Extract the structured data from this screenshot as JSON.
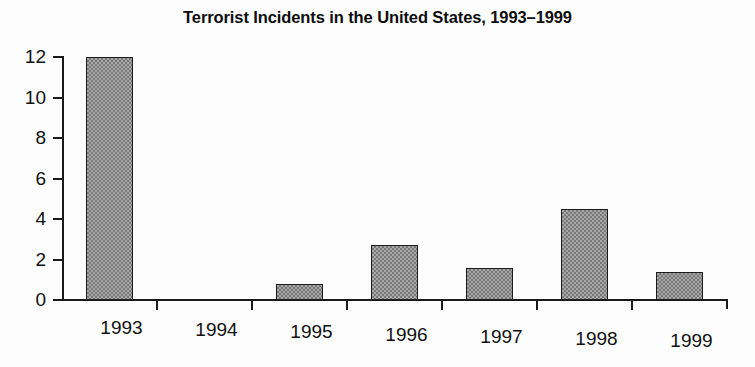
{
  "chart_data": {
    "type": "bar",
    "title": "Terrorist Incidents in the United States, 1993–1999",
    "xlabel": "",
    "ylabel": "",
    "categories": [
      "1993",
      "1994",
      "1995",
      "1996",
      "1997",
      "1998",
      "1999"
    ],
    "values": [
      12,
      0,
      0.8,
      2.7,
      1.6,
      4.5,
      1.4
    ],
    "ylim": [
      0,
      12
    ],
    "yticks": [
      0,
      2,
      4,
      6,
      8,
      10,
      12
    ],
    "ytick_labels": [
      "0",
      "2",
      "4",
      "6",
      "8",
      "10",
      "12"
    ],
    "grid": false,
    "legend": null,
    "series": [
      {
        "name": "Terrorist Incidents",
        "values": [
          12,
          0,
          0.8,
          2.7,
          1.6,
          4.5,
          1.4
        ]
      }
    ],
    "bar_fill_color": "#a8a8a8",
    "bar_border_color": "#1c1c1c",
    "axis_color": "#1a1a1a",
    "background_color": "#ffffff"
  }
}
